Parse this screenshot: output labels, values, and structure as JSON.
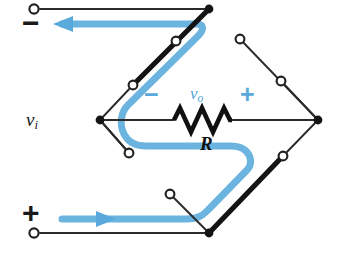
{
  "figure": {
    "type": "circuit-diagram",
    "background_color": "#ffffff"
  },
  "colors": {
    "wire": "#2b2b2b",
    "node_fill": "#1a1a1a",
    "terminal_fill": "#ffffff",
    "current_path": "#5aa9dc",
    "current_path_light": "#7cbde4",
    "label_black": "#1a1a1a",
    "label_blue": "#53a3d8"
  },
  "labels": {
    "input_source": "v",
    "input_source_sub": "i",
    "output_voltage": "v",
    "output_voltage_sub": "o",
    "resistor": "R",
    "input_minus": "−",
    "input_plus": "+",
    "output_minus": "−",
    "output_plus": "+"
  },
  "terminals": [
    {
      "name": "input-negative-terminal",
      "x": 34,
      "y": 9,
      "label": "−"
    },
    {
      "name": "input-positive-terminal",
      "x": 34,
      "y": 234,
      "label": "+"
    }
  ],
  "nodes": [
    {
      "name": "top-junction",
      "x": 209,
      "y": 9
    },
    {
      "name": "left-junction",
      "x": 100,
      "y": 120
    },
    {
      "name": "right-junction",
      "x": 318,
      "y": 120
    },
    {
      "name": "bottom-junction",
      "x": 209,
      "y": 233
    }
  ],
  "switches": [
    {
      "name": "switch-top-left",
      "state": "closed",
      "pivot_x": 209,
      "pivot_y": 9,
      "contact_closed_x": 133,
      "contact_closed_y": 85,
      "contact_open_x": 176,
      "contact_open_y": 41
    },
    {
      "name": "switch-top-right",
      "state": "open",
      "pivot_x": 318,
      "pivot_y": 120,
      "contact_open_x": 281,
      "contact_open_y": 81,
      "contact_closed_x": 240,
      "contact_closed_y": 39
    },
    {
      "name": "switch-bottom-right",
      "state": "closed",
      "pivot_x": 209,
      "pivot_y": 233,
      "contact_closed_x": 283,
      "contact_closed_y": 156,
      "contact_open_x": 241,
      "contact_open_y": 199
    },
    {
      "name": "switch-bottom-left",
      "state": "open",
      "pivot_x": 100,
      "pivot_y": 120,
      "contact_open_x": 129,
      "contact_open_y": 153,
      "contact_closed_x": 170,
      "contact_closed_y": 194
    }
  ],
  "resistor": {
    "name": "resistor-R",
    "x_start": 174,
    "x_end": 232,
    "y": 120,
    "label": "R"
  },
  "current_arrows": [
    {
      "name": "current-arrow-top",
      "direction": "left",
      "y": 24,
      "x_from": 196,
      "x_to": 62
    },
    {
      "name": "current-arrow-bottom",
      "direction": "right",
      "y": 219,
      "x_from": 62,
      "x_to": 196
    }
  ],
  "current_path_description": "Blue trace enters at the bottom-left positive terminal, flows right to the bottom junction, up through the closed bottom-right switch, left under the resistor past R, loops around the left junction, up through the closed top-left switch, and exits left at the top negative terminal."
}
